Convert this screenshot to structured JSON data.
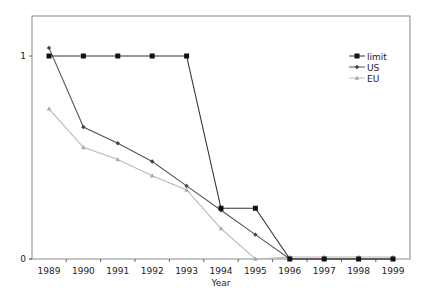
{
  "chart_data": {
    "type": "line",
    "title": "",
    "xlabel": "Year",
    "ylabel": "",
    "x": [
      "1989",
      "1990",
      "1991",
      "1992",
      "1993",
      "1994",
      "1995",
      "1996",
      "1997",
      "1998",
      "1999"
    ],
    "ylim": [
      0,
      1.2
    ],
    "yticks": [
      {
        "value": 0,
        "label": "0"
      },
      {
        "value": 1,
        "label": "1"
      }
    ],
    "grid": false,
    "legend_position": "upper right",
    "series": [
      {
        "name": "limit",
        "marker": "square",
        "color": "#111111",
        "line_color": "#333333",
        "values": [
          1,
          1,
          1,
          1,
          1,
          0.25,
          0.25,
          0,
          0,
          0,
          0
        ]
      },
      {
        "name": "US",
        "marker": "diamond",
        "color": "#444444",
        "line_color": "#555555",
        "values": [
          1.04,
          0.65,
          0.57,
          0.48,
          0.36,
          0.24,
          0.12,
          0,
          0,
          0,
          0
        ]
      },
      {
        "name": "EU",
        "marker": "triangle",
        "color": "#aaaaaa",
        "line_color": "#b8b8b8",
        "values": [
          0.74,
          0.55,
          0.49,
          0.41,
          0.34,
          0.15,
          0,
          0.01,
          0.01,
          0.01,
          0.01
        ]
      }
    ]
  }
}
